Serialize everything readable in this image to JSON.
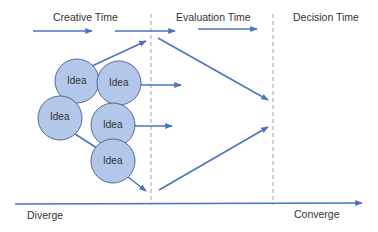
{
  "diagram": {
    "phases": [
      {
        "label": "Creative Time"
      },
      {
        "label": "Evaluation Time"
      },
      {
        "label": "Decision Time"
      }
    ],
    "ideas": [
      {
        "label": "Idea"
      },
      {
        "label": "Idea"
      },
      {
        "label": "Idea"
      },
      {
        "label": "Idea"
      },
      {
        "label": "Idea"
      }
    ],
    "axis": {
      "start_label": "Diverge",
      "end_label": "Converge"
    },
    "colors": {
      "arrow": "#4a72c4",
      "circle_fill": "#b3c7ea",
      "circle_stroke": "#55698c",
      "divider": "#9aa3b8",
      "text": "#333333"
    }
  }
}
